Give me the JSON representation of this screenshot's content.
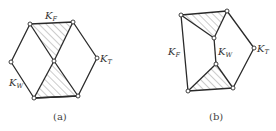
{
  "figure": {
    "panels": [
      {
        "id": "a",
        "caption": "(a)",
        "labels": {
          "kf": "K",
          "kf_sub": "F",
          "kt": "K",
          "kt_sub": "T",
          "kw": "K",
          "kw_sub": "W"
        }
      },
      {
        "id": "b",
        "caption": "(b)",
        "labels": {
          "kf": "K",
          "kf_sub": "F",
          "kt": "K",
          "kt_sub": "T",
          "kw": "K",
          "kw_sub": "W"
        }
      }
    ],
    "colors": {
      "line": "#2a2a2a",
      "hatch": "#6a6a6a",
      "background": "#ffffff"
    }
  }
}
